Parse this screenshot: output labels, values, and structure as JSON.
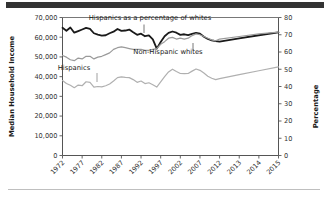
{
  "figure": {
    "background_color": "#ffffff",
    "top_bar_color": "#333333",
    "bottom_rule_color": "#bfbfbf"
  },
  "chart_data": {
    "type": "line",
    "title": "",
    "xlabel": "",
    "ylabel": "Median Household Income",
    "y2label": "Percentage",
    "ylim": [
      0,
      70000
    ],
    "y2lim": [
      0,
      80
    ],
    "grid": false,
    "legend": "inline-annotations",
    "y_ticks": [
      "0",
      "10,000",
      "20,000",
      "30,000",
      "40,000",
      "50,000",
      "60,000",
      "70,000"
    ],
    "y_tick_values": [
      0,
      10000,
      20000,
      30000,
      40000,
      50000,
      60000,
      70000
    ],
    "y2_ticks": [
      "0",
      "10",
      "20",
      "30",
      "40",
      "50",
      "60",
      "70",
      "80"
    ],
    "y2_tick_values": [
      0,
      10,
      20,
      30,
      40,
      50,
      60,
      70,
      80
    ],
    "x_tick_labels": [
      "1972",
      "1977",
      "1982",
      "1987",
      "1992",
      "1997",
      "2002",
      "2007",
      "2012",
      "2013",
      "2014",
      "2015"
    ],
    "x_tick_years": [
      1972,
      1977,
      1982,
      1987,
      1992,
      1997,
      2002,
      2007,
      2012,
      2013,
      2014,
      2015
    ],
    "x_years": [
      1972,
      1973,
      1974,
      1975,
      1976,
      1977,
      1978,
      1979,
      1980,
      1981,
      1982,
      1983,
      1984,
      1985,
      1986,
      1987,
      1988,
      1989,
      1990,
      1991,
      1992,
      1993,
      1994,
      1995,
      1996,
      1997,
      1998,
      1999,
      2000,
      2001,
      2002,
      2003,
      2004,
      2005,
      2006,
      2007,
      2008,
      2009,
      2010,
      2011,
      2012,
      2013,
      2014,
      2015
    ],
    "series": [
      {
        "name": "Non-Hispanic whites",
        "axis": "left",
        "unit": "Median Household Income",
        "color": "#1a1a1a",
        "width": 1.8,
        "label_text": "Non-Hispanic whites",
        "values": [
          64800,
          63300,
          64900,
          62300,
          63100,
          63900,
          64700,
          64200,
          62000,
          61300,
          60800,
          61000,
          62000,
          62800,
          64200,
          63200,
          63400,
          63900,
          62500,
          61200,
          61800,
          60500,
          60900,
          58900,
          54200,
          57600,
          60500,
          62200,
          62900,
          62300,
          61200,
          61500,
          61100,
          61700,
          62200,
          61800,
          60200,
          59100,
          58400,
          58000,
          57800,
          59400,
          61000,
          62500
        ]
      },
      {
        "name": "Hispanics as a percentage of whites",
        "axis": "right",
        "unit": "Percentage",
        "color": "#9a9a9a",
        "width": 1.2,
        "label_text": "Hispanics as a percentage of whites",
        "values": [
          58.0,
          57.0,
          55.5,
          55.0,
          56.5,
          56.0,
          57.5,
          57.5,
          56.0,
          57.0,
          57.5,
          58.5,
          59.5,
          61.5,
          62.5,
          63.0,
          62.5,
          62.0,
          61.5,
          61.5,
          61.5,
          61.0,
          61.0,
          61.5,
          62.0,
          64.5,
          66.0,
          68.0,
          68.5,
          67.5,
          68.0,
          67.5,
          68.0,
          69.5,
          70.5,
          70.0,
          69.0,
          68.0,
          67.0,
          66.5,
          67.5,
          69.0,
          70.5,
          71.5
        ]
      },
      {
        "name": "Hispanics",
        "axis": "left",
        "unit": "Median Household Income",
        "color": "#b0b0b0",
        "width": 1.2,
        "label_text": "Hispanics",
        "values": [
          38000,
          36500,
          35600,
          34400,
          35700,
          35400,
          37400,
          37100,
          34700,
          35000,
          34800,
          35400,
          36300,
          37800,
          39500,
          39900,
          39600,
          39500,
          38500,
          37100,
          37800,
          36500,
          36900,
          35900,
          34700,
          37300,
          40000,
          42400,
          43800,
          42600,
          41600,
          41500,
          41600,
          42800,
          43900,
          43200,
          41800,
          40200,
          39200,
          38500,
          39000,
          41000,
          43000,
          45000
        ]
      }
    ],
    "annotations": [
      {
        "text": "Hispanics as a percentage of whites",
        "x": 150,
        "y": 20
      },
      {
        "text": "Non-Hispanic whites",
        "x": 168,
        "y": 54
      },
      {
        "text": "Hispanics",
        "x": 74,
        "y": 70
      }
    ]
  }
}
